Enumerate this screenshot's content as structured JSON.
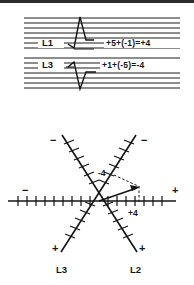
{
  "figure": {
    "title_visible": false,
    "ink_color": "#161616",
    "paper_color": "#ffffff",
    "border_color": "#2b2b2b"
  },
  "staff_sections": [
    {
      "id": "staff-1",
      "line_label": "L1",
      "equation": "+5+(-1)=+4",
      "rule_count": 7
    },
    {
      "id": "staff-2",
      "line_label": "L3",
      "equation": "+1+(-5)=-4",
      "rule_count": 7
    }
  ],
  "star_diagram": {
    "horizontal_axis": {
      "left_sign": "−",
      "right_sign": "+"
    },
    "diagonal_l3": {
      "upper_sign": "−",
      "lower_sign": "+",
      "name": "L3"
    },
    "diagonal_l2": {
      "upper_sign": "−",
      "lower_sign": "+",
      "name": "L2"
    },
    "annotations": {
      "negative_four": "-4",
      "positive_four": "+4"
    }
  }
}
